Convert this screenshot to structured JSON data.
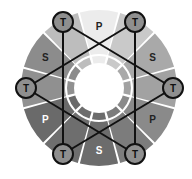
{
  "diagram": {
    "title": "",
    "type": "color-wheel",
    "center": [
      99,
      88
    ],
    "outer_radius": 78,
    "inner_ring_radius": 32,
    "hole_radius": 25,
    "segments": [
      {
        "label": "P",
        "angle": 0,
        "fill": "#ececec",
        "text_color": "#222222",
        "show_label": true
      },
      {
        "label": "T",
        "angle": 30,
        "fill": "#c9c9c9",
        "text_color": "#222222",
        "show_label": false
      },
      {
        "label": "S",
        "angle": 60,
        "fill": "#a9a9a9",
        "text_color": "#222222",
        "show_label": true
      },
      {
        "label": "T",
        "angle": 90,
        "fill": "#a2a2a2",
        "text_color": "#222222",
        "show_label": false
      },
      {
        "label": "P",
        "angle": 120,
        "fill": "#8a8a8a",
        "text_color": "#222222",
        "show_label": true
      },
      {
        "label": "T",
        "angle": 150,
        "fill": "#7c7c7c",
        "text_color": "#222222",
        "show_label": false
      },
      {
        "label": "S",
        "angle": 180,
        "fill": "#6c6c6c",
        "text_color": "#ffffff",
        "show_label": true
      },
      {
        "label": "T",
        "angle": 210,
        "fill": "#6e6e6e",
        "text_color": "#ffffff",
        "show_label": false
      },
      {
        "label": "P",
        "angle": 240,
        "fill": "#6a6a6a",
        "text_color": "#ffffff",
        "show_label": true
      },
      {
        "label": "T",
        "angle": 270,
        "fill": "#909090",
        "text_color": "#222222",
        "show_label": false
      },
      {
        "label": "S",
        "angle": 300,
        "fill": "#8c8c8c",
        "text_color": "#222222",
        "show_label": true
      },
      {
        "label": "T",
        "angle": 330,
        "fill": "#bdbdbd",
        "text_color": "#222222",
        "show_label": false
      }
    ],
    "nodes": [
      {
        "id": "t-top-left",
        "label": "T",
        "x": 63,
        "y": 22
      },
      {
        "id": "t-top-right",
        "label": "T",
        "x": 135,
        "y": 22
      },
      {
        "id": "t-left",
        "label": "T",
        "x": 26,
        "y": 88
      },
      {
        "id": "t-right",
        "label": "T",
        "x": 173,
        "y": 88
      },
      {
        "id": "t-bottom-left",
        "label": "T",
        "x": 63,
        "y": 154
      },
      {
        "id": "t-bottom-right",
        "label": "T",
        "x": 135,
        "y": 154
      }
    ],
    "node_radius": 10,
    "node_fill": "#8f8f8f",
    "connections": [
      [
        "t-top-left",
        "t-bottom-left"
      ],
      [
        "t-top-right",
        "t-bottom-right"
      ],
      [
        "t-top-left",
        "t-right"
      ],
      [
        "t-top-right",
        "t-left"
      ],
      [
        "t-left",
        "t-bottom-right"
      ],
      [
        "t-right",
        "t-bottom-left"
      ]
    ],
    "legend": {
      "P": "Primary",
      "S": "Secondary",
      "T": "Tertiary"
    }
  }
}
